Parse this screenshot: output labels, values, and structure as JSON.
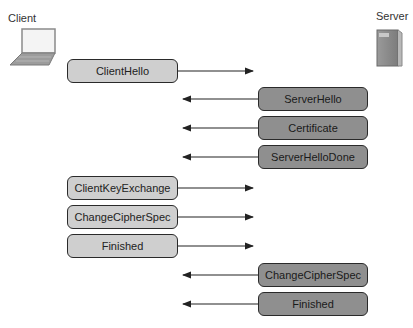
{
  "labels": {
    "client": "Client",
    "server": "Server"
  },
  "icons": {
    "client": "laptop-icon",
    "server": "server-tower-icon"
  },
  "colors": {
    "client_box": "#cfcfcf",
    "server_box": "#8f8f8f",
    "border": "#2a2a2a"
  },
  "messages": [
    {
      "text": "ClientHello",
      "from": "client",
      "top": 59
    },
    {
      "text": "ServerHello",
      "from": "server",
      "top": 87
    },
    {
      "text": "Certificate",
      "from": "server",
      "top": 116
    },
    {
      "text": "ServerHelloDone",
      "from": "server",
      "top": 145
    },
    {
      "text": "ClientKeyExchange",
      "from": "client",
      "top": 176
    },
    {
      "text": "ChangeCipherSpec",
      "from": "client",
      "top": 205
    },
    {
      "text": "Finished",
      "from": "client",
      "top": 234
    },
    {
      "text": "ChangeCipherSpec",
      "from": "server",
      "top": 263
    },
    {
      "text": "Finished",
      "from": "server",
      "top": 292
    }
  ]
}
